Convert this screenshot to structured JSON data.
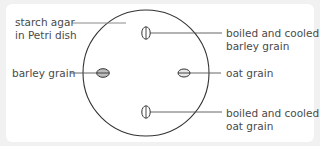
{
  "diagram": {
    "labels": {
      "starch_agar_line1": "starch agar",
      "starch_agar_line2": "in Petri dish",
      "barley_grain": "barley grain",
      "boiled_barley_line1": "boiled and cooled",
      "boiled_barley_line2": "barley grain",
      "oat_grain": "oat grain",
      "boiled_oat_line1": "boiled and cooled",
      "boiled_oat_line2": "oat grain"
    },
    "colors": {
      "background": "#f1f1f1",
      "panel": "#ffffff",
      "dish_outline": "#333333",
      "leader_line": "#777777",
      "grain_fill_raw": "#bdbdbd",
      "grain_fill_boiled": "#ffffff",
      "text": "#4a4a4a"
    },
    "dish": {
      "cx": 146,
      "cy": 73,
      "r": 63
    },
    "grains": [
      {
        "name": "boiled-barley-grain",
        "cx": 146,
        "cy": 33,
        "orientation": "vertical",
        "boiled": true
      },
      {
        "name": "barley-grain",
        "cx": 103,
        "cy": 73,
        "orientation": "horizontal",
        "boiled": false
      },
      {
        "name": "oat-grain",
        "cx": 184,
        "cy": 73,
        "orientation": "horizontal",
        "boiled": false
      },
      {
        "name": "boiled-oat-grain",
        "cx": 146,
        "cy": 112,
        "orientation": "vertical",
        "boiled": true
      }
    ]
  }
}
